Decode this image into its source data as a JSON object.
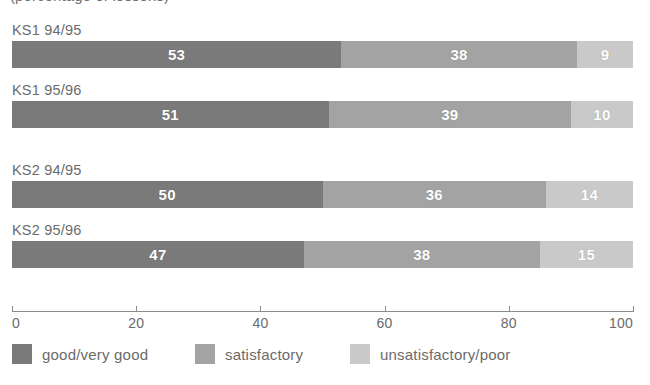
{
  "chart_data": {
    "type": "bar",
    "orientation": "horizontal",
    "stacked": true,
    "title": "(percentage of lessons)",
    "xlabel": "",
    "ylabel": "",
    "xlim": [
      0,
      100
    ],
    "grid": false,
    "legend_position": "bottom",
    "categories": [
      "KS1 94/95",
      "KS1 95/96",
      "KS2 94/95",
      "KS2 95/96"
    ],
    "series": [
      {
        "name": "good/very good",
        "color": "#7a7a7a",
        "values": [
          53,
          51,
          50,
          47
        ]
      },
      {
        "name": "satisfactory",
        "color": "#a3a3a3",
        "values": [
          38,
          39,
          36,
          38
        ]
      },
      {
        "name": "unsatisfactory/poor",
        "color": "#c9c9c9",
        "values": [
          9,
          10,
          14,
          15
        ]
      }
    ],
    "xticks": [
      0,
      20,
      40,
      60,
      80,
      100
    ],
    "xtick_labels": [
      "0",
      "20",
      "40",
      "60",
      "80",
      "100"
    ],
    "bars": [
      {
        "label": "KS1 94/95",
        "segments": [
          {
            "series": "good/very good",
            "value": 53,
            "value_label": "53",
            "color": "#7a7a7a"
          },
          {
            "series": "satisfactory",
            "value": 38,
            "value_label": "38",
            "color": "#a3a3a3"
          },
          {
            "series": "unsatisfactory/poor",
            "value": 9,
            "value_label": "9",
            "color": "#c9c9c9"
          }
        ]
      },
      {
        "label": "KS1 95/96",
        "segments": [
          {
            "series": "good/very good",
            "value": 51,
            "value_label": "51",
            "color": "#7a7a7a"
          },
          {
            "series": "satisfactory",
            "value": 39,
            "value_label": "39",
            "color": "#a3a3a3"
          },
          {
            "series": "unsatisfactory/poor",
            "value": 10,
            "value_label": "10",
            "color": "#c9c9c9"
          }
        ]
      },
      {
        "label": "KS2 94/95",
        "segments": [
          {
            "series": "good/very good",
            "value": 50,
            "value_label": "50",
            "color": "#7a7a7a"
          },
          {
            "series": "satisfactory",
            "value": 36,
            "value_label": "36",
            "color": "#a3a3a3"
          },
          {
            "series": "unsatisfactory/poor",
            "value": 14,
            "value_label": "14",
            "color": "#c9c9c9"
          }
        ]
      },
      {
        "label": "KS2 95/96",
        "segments": [
          {
            "series": "good/very good",
            "value": 47,
            "value_label": "47",
            "color": "#7a7a7a"
          },
          {
            "series": "satisfactory",
            "value": 38,
            "value_label": "38",
            "color": "#a3a3a3"
          },
          {
            "series": "unsatisfactory/poor",
            "value": 15,
            "value_label": "15",
            "color": "#c9c9c9"
          }
        ]
      }
    ],
    "legend": [
      {
        "label": "good/very good",
        "color": "#7a7a7a"
      },
      {
        "label": "satisfactory",
        "color": "#a3a3a3"
      },
      {
        "label": "unsatisfactory/poor",
        "color": "#c9c9c9"
      }
    ]
  },
  "layout": {
    "bar_tops": [
      22,
      82,
      162,
      222
    ],
    "legend_lefts": [
      12,
      195,
      350
    ]
  },
  "colors": {
    "axis": "#8d8d8d",
    "text": "#6b6b6b",
    "value_text": "#ffffff",
    "background": "#ffffff"
  }
}
